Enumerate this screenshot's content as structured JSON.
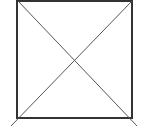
{
  "diagram": {
    "type": "square-with-diagonals",
    "square": {
      "x": 17,
      "y": 1,
      "width": 115,
      "height": 117,
      "stroke": "#333333",
      "stroke_width": 2
    },
    "diagonals": [
      {
        "x1": 18,
        "y1": 1,
        "x2": 137,
        "y2": 126,
        "stroke": "#555555",
        "stroke_width": 1
      },
      {
        "x1": 132,
        "y1": 1,
        "x2": 11,
        "y2": 126,
        "stroke": "#555555",
        "stroke_width": 1
      }
    ],
    "background": "#ffffff"
  }
}
